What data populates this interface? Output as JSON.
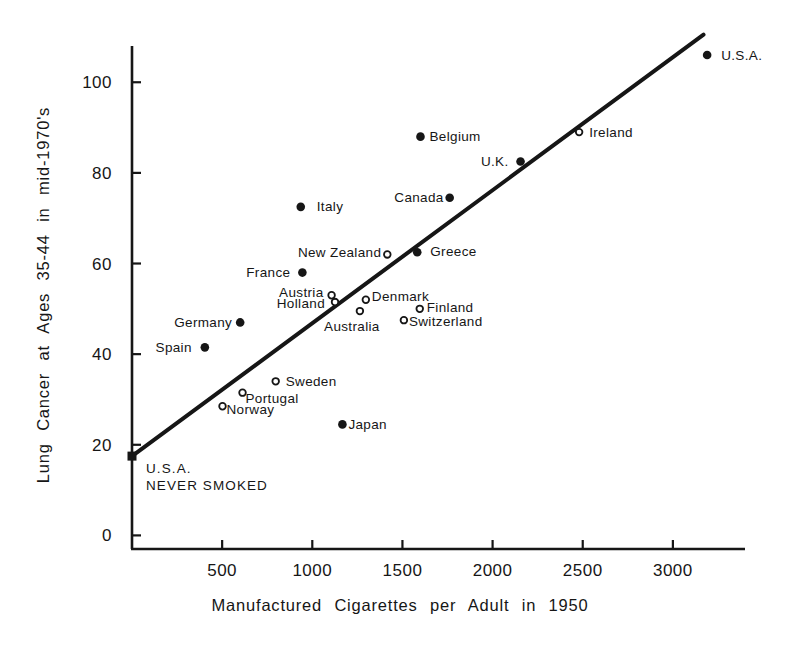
{
  "figure": {
    "background": "#ffffff",
    "ink_color": "#161616"
  },
  "chart_data": {
    "type": "scatter",
    "title": "",
    "xlabel": "Manufactured Cigarettes per Adult in 1950",
    "ylabel": "Lung Cancer at Ages 35-44 in mid-1970's",
    "xlim": [
      0,
      3400
    ],
    "ylim": [
      -3,
      108
    ],
    "x_ticks": [
      "500",
      "1000",
      "1500",
      "2000",
      "2500",
      "3000"
    ],
    "x_tick_values": [
      500,
      1000,
      1500,
      2000,
      2500,
      3000
    ],
    "y_ticks": [
      "0",
      "20",
      "40",
      "60",
      "80",
      "100"
    ],
    "y_tick_values": [
      0,
      20,
      40,
      60,
      80,
      100
    ],
    "grid": false,
    "legend": false,
    "points": [
      {
        "label": "U.S.A.",
        "x": 3190,
        "y": 106,
        "marker": "filled",
        "anchor": "start",
        "dx": 14,
        "dy": 4.5
      },
      {
        "label": "Ireland",
        "x": 2480,
        "y": 89,
        "marker": "open",
        "anchor": "start",
        "dx": 10,
        "dy": 4.5
      },
      {
        "label": "Belgium",
        "x": 1600,
        "y": 88,
        "marker": "filled",
        "anchor": "start",
        "dx": 9,
        "dy": 4.5
      },
      {
        "label": "U.K.",
        "x": 2155,
        "y": 82.5,
        "marker": "filled",
        "anchor": "end",
        "dx": -12,
        "dy": 4.5
      },
      {
        "label": "Canada",
        "x": 1762,
        "y": 74.5,
        "marker": "filled",
        "anchor": "end",
        "dx": -6,
        "dy": 4.5
      },
      {
        "label": "Italy",
        "x": 936,
        "y": 72.5,
        "marker": "filled",
        "anchor": "start",
        "dx": 16,
        "dy": 4.5
      },
      {
        "label": "Greece",
        "x": 1582,
        "y": 62.5,
        "marker": "filled",
        "anchor": "start",
        "dx": 13,
        "dy": 4
      },
      {
        "label": "New Zealand",
        "x": 1416,
        "y": 62,
        "marker": "open",
        "anchor": "end",
        "dx": -6,
        "dy": 2.5
      },
      {
        "label": "France",
        "x": 945,
        "y": 58,
        "marker": "filled",
        "anchor": "end",
        "dx": -12,
        "dy": 4.5
      },
      {
        "label": "Austria",
        "x": 1107,
        "y": 53,
        "marker": "open",
        "anchor": "end",
        "dx": -8,
        "dy": 2
      },
      {
        "label": "Holland",
        "x": 1126,
        "y": 51.5,
        "marker": "open",
        "anchor": "end",
        "dx": -10,
        "dy": 6
      },
      {
        "label": "Denmark",
        "x": 1297,
        "y": 52,
        "marker": "open",
        "anchor": "start",
        "dx": 6,
        "dy": 1
      },
      {
        "label": "Australia",
        "x": 1264,
        "y": 49.5,
        "marker": "open",
        "anchor": "middle",
        "dx": -8,
        "dy": 19.5
      },
      {
        "label": "Finland",
        "x": 1596,
        "y": 50,
        "marker": "open",
        "anchor": "start",
        "dx": 7,
        "dy": 3.5
      },
      {
        "label": "Switzerland",
        "x": 1508,
        "y": 47.5,
        "marker": "open",
        "anchor": "start",
        "dx": 5,
        "dy": 6
      },
      {
        "label": "Germany",
        "x": 600,
        "y": 47,
        "marker": "filled",
        "anchor": "end",
        "dx": -8,
        "dy": 4.5
      },
      {
        "label": "Spain",
        "x": 404,
        "y": 41.5,
        "marker": "filled",
        "anchor": "end",
        "dx": -13,
        "dy": 4.5
      },
      {
        "label": "Sweden",
        "x": 797,
        "y": 34,
        "marker": "open",
        "anchor": "start",
        "dx": 10,
        "dy": 4.5
      },
      {
        "label": "Portugal",
        "x": 613,
        "y": 31.5,
        "marker": "open",
        "anchor": "start",
        "dx": 3,
        "dy": 10.5
      },
      {
        "label": "Norway",
        "x": 502,
        "y": 28.5,
        "marker": "open",
        "anchor": "start",
        "dx": 4,
        "dy": 8
      },
      {
        "label": "Japan",
        "x": 1167,
        "y": 24.5,
        "marker": "filled",
        "anchor": "start",
        "dx": 6,
        "dy": 4.5
      }
    ],
    "never_smoked_point": {
      "label_lines": [
        "U.S.A.",
        "NEVER SMOKED"
      ],
      "x": 0,
      "y": 17.5,
      "marker": "square",
      "dx": 14,
      "dy": 17,
      "line_gap": 17
    },
    "trend_line": {
      "x1": 0,
      "y1": 17.5,
      "x2": 3170,
      "y2": 110.5
    }
  }
}
